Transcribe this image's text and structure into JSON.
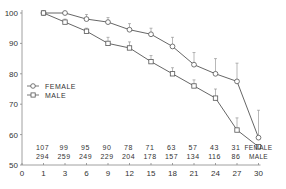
{
  "chart_data": {
    "type": "line",
    "title": "",
    "xlabel": "",
    "ylabel": "",
    "ylim": [
      50,
      100
    ],
    "yticks": [
      50,
      60,
      70,
      80,
      90,
      100
    ],
    "x": [
      1,
      3,
      6,
      9,
      12,
      15,
      18,
      21,
      24,
      27,
      30
    ],
    "xticks": [
      0,
      1,
      3,
      6,
      9,
      12,
      15,
      18,
      21,
      24,
      27,
      30
    ],
    "grid": false,
    "legend_position": "left-middle",
    "series": [
      {
        "name": "FEMALE",
        "marker": "circle",
        "values": [
          100,
          100,
          98,
          97,
          94.5,
          93,
          89,
          83,
          80,
          77.5,
          59
        ],
        "error_upper": [
          0,
          0,
          1.5,
          1.5,
          2,
          2,
          3,
          4,
          5,
          6,
          9
        ],
        "n_at_risk": [
          107,
          99,
          95,
          90,
          78,
          71,
          63,
          57,
          43,
          31
        ]
      },
      {
        "name": "MALE",
        "marker": "square",
        "values": [
          100,
          97,
          94,
          90,
          88.5,
          84,
          80,
          76,
          72,
          61.5,
          56
        ],
        "error_upper": [
          0,
          1,
          1,
          2,
          2,
          2,
          2,
          2,
          3,
          4,
          0
        ],
        "n_at_risk": [
          294,
          259,
          249,
          229,
          204,
          178,
          157,
          134,
          116,
          86
        ]
      }
    ],
    "annotations": {
      "row_labels": [
        "FEMALE",
        "MALE"
      ]
    }
  }
}
